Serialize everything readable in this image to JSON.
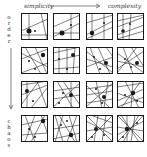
{
  "labels": {
    "top_left": "simplicity",
    "top_right": "complexity",
    "left_top": "order",
    "left_bottom": "chaos"
  },
  "grid": {
    "rows": 4,
    "cols": 4,
    "cells": [
      {
        "row": 0,
        "col": 0,
        "lines": [
          [
            8,
            0,
            8,
            27
          ],
          [
            20,
            0,
            26,
            27
          ],
          [
            0,
            18,
            27,
            6
          ],
          [
            0,
            22,
            27,
            22
          ]
        ],
        "dots": [
          [
            8,
            18,
            2.5
          ],
          [
            14,
            18,
            1
          ]
        ]
      },
      {
        "row": 0,
        "col": 1,
        "lines": [
          [
            0,
            14,
            27,
            2
          ],
          [
            0,
            24,
            27,
            10
          ],
          [
            18,
            0,
            18,
            27
          ],
          [
            0,
            20,
            27,
            20
          ]
        ],
        "dots": [
          [
            9,
            20,
            2.5
          ],
          [
            18,
            12,
            1
          ]
        ]
      },
      {
        "row": 0,
        "col": 2,
        "lines": [
          [
            0,
            10,
            27,
            2
          ],
          [
            0,
            22,
            27,
            8
          ],
          [
            0,
            26,
            27,
            14
          ],
          [
            6,
            0,
            6,
            27
          ],
          [
            18,
            0,
            18,
            27
          ]
        ],
        "dots": [
          [
            6,
            20,
            2.2
          ],
          [
            18,
            10,
            1
          ]
        ]
      },
      {
        "row": 0,
        "col": 3,
        "lines": [
          [
            0,
            8,
            27,
            2
          ],
          [
            0,
            14,
            27,
            4
          ],
          [
            0,
            22,
            27,
            12
          ],
          [
            0,
            26,
            27,
            18
          ],
          [
            6,
            0,
            6,
            27
          ],
          [
            14,
            0,
            12,
            27
          ]
        ],
        "dots": [
          [
            6,
            18,
            1.8
          ],
          [
            13,
            11,
            1
          ]
        ]
      },
      {
        "row": 1,
        "col": 0,
        "lines": [
          [
            0,
            12,
            27,
            2
          ],
          [
            0,
            26,
            27,
            16
          ],
          [
            4,
            0,
            20,
            27
          ],
          [
            14,
            0,
            26,
            27
          ],
          [
            0,
            6,
            27,
            20
          ]
        ],
        "dots": [
          [
            22,
            8,
            2.2
          ],
          [
            8,
            14,
            1
          ],
          [
            14,
            22,
            1
          ]
        ]
      },
      {
        "row": 1,
        "col": 1,
        "lines": [
          [
            0,
            6,
            27,
            0
          ],
          [
            0,
            14,
            27,
            8
          ],
          [
            0,
            22,
            27,
            20
          ],
          [
            6,
            0,
            6,
            27
          ],
          [
            14,
            0,
            14,
            27
          ],
          [
            22,
            0,
            20,
            27
          ]
        ],
        "dots": [
          [
            20,
            8,
            2
          ],
          [
            6,
            12,
            1
          ],
          [
            14,
            22,
            1
          ]
        ]
      },
      {
        "row": 1,
        "col": 2,
        "lines": [
          [
            0,
            4,
            27,
            26
          ],
          [
            0,
            12,
            27,
            20
          ],
          [
            4,
            0,
            14,
            27
          ],
          [
            12,
            0,
            24,
            27
          ],
          [
            0,
            20,
            27,
            10
          ],
          [
            20,
            0,
            27,
            10
          ]
        ],
        "dots": [
          [
            20,
            16,
            2
          ],
          [
            8,
            10,
            1
          ],
          [
            14,
            22,
            1
          ]
        ]
      },
      {
        "row": 1,
        "col": 3,
        "lines": [
          [
            0,
            6,
            27,
            26
          ],
          [
            0,
            14,
            27,
            20
          ],
          [
            6,
            0,
            16,
            27
          ],
          [
            14,
            0,
            27,
            20
          ],
          [
            0,
            22,
            27,
            4
          ],
          [
            20,
            0,
            0,
            26
          ]
        ],
        "dots": [
          [
            20,
            16,
            2
          ],
          [
            8,
            12,
            1
          ],
          [
            14,
            20,
            1
          ]
        ]
      },
      {
        "row": 2,
        "col": 0,
        "lines": [
          [
            0,
            4,
            27,
            0
          ],
          [
            0,
            14,
            27,
            4
          ],
          [
            6,
            0,
            6,
            27
          ],
          [
            16,
            0,
            26,
            27
          ],
          [
            0,
            24,
            18,
            0
          ],
          [
            10,
            27,
            27,
            6
          ]
        ],
        "dots": [
          [
            6,
            10,
            2
          ],
          [
            12,
            20,
            1
          ]
        ]
      },
      {
        "row": 2,
        "col": 1,
        "lines": [
          [
            0,
            10,
            27,
            6
          ],
          [
            0,
            18,
            27,
            14
          ],
          [
            4,
            0,
            20,
            27
          ],
          [
            18,
            0,
            18,
            27
          ],
          [
            0,
            26,
            27,
            2
          ],
          [
            10,
            0,
            27,
            24
          ]
        ],
        "dots": [
          [
            18,
            14,
            2
          ],
          [
            10,
            12,
            1
          ],
          [
            6,
            22,
            1
          ]
        ]
      },
      {
        "row": 2,
        "col": 2,
        "lines": [
          [
            0,
            8,
            27,
            4
          ],
          [
            0,
            14,
            27,
            10
          ],
          [
            0,
            22,
            27,
            18
          ],
          [
            10,
            0,
            16,
            27
          ],
          [
            22,
            0,
            18,
            27
          ],
          [
            0,
            4,
            24,
            27
          ],
          [
            0,
            26,
            27,
            2
          ]
        ],
        "dots": [
          [
            18,
            16,
            2
          ],
          [
            10,
            8,
            1
          ],
          [
            16,
            22,
            1
          ]
        ]
      },
      {
        "row": 2,
        "col": 3,
        "lines": [
          [
            0,
            6,
            27,
            2
          ],
          [
            0,
            12,
            27,
            22
          ],
          [
            0,
            20,
            27,
            8
          ],
          [
            8,
            0,
            22,
            27
          ],
          [
            16,
            0,
            14,
            27
          ],
          [
            24,
            0,
            4,
            27
          ],
          [
            0,
            26,
            27,
            16
          ]
        ],
        "dots": [
          [
            16,
            12,
            2.2
          ],
          [
            8,
            14,
            1
          ],
          [
            20,
            20,
            1
          ]
        ]
      },
      {
        "row": 3,
        "col": 0,
        "lines": [
          [
            4,
            0,
            14,
            27
          ],
          [
            14,
            0,
            4,
            27
          ],
          [
            20,
            0,
            27,
            20
          ],
          [
            0,
            10,
            27,
            4
          ],
          [
            0,
            20,
            27,
            18
          ],
          [
            10,
            27,
            24,
            0
          ]
        ],
        "dots": [
          [
            22,
            6,
            2.2
          ],
          [
            8,
            14,
            1
          ],
          [
            14,
            22,
            1
          ]
        ]
      },
      {
        "row": 3,
        "col": 1,
        "lines": [
          [
            2,
            0,
            10,
            27
          ],
          [
            10,
            0,
            2,
            27
          ],
          [
            16,
            0,
            24,
            27
          ],
          [
            24,
            0,
            14,
            27
          ],
          [
            0,
            14,
            27,
            10
          ],
          [
            0,
            24,
            27,
            18
          ],
          [
            6,
            0,
            22,
            27
          ]
        ],
        "dots": [
          [
            18,
            20,
            2.2
          ],
          [
            8,
            10,
            1
          ],
          [
            14,
            6,
            1
          ]
        ]
      },
      {
        "row": 3,
        "col": 2,
        "lines": [
          [
            0,
            0,
            27,
            27
          ],
          [
            27,
            0,
            0,
            27
          ],
          [
            12,
            0,
            8,
            27
          ],
          [
            20,
            0,
            16,
            27
          ],
          [
            0,
            16,
            27,
            12
          ],
          [
            0,
            6,
            27,
            20
          ],
          [
            4,
            0,
            27,
            8
          ]
        ],
        "dots": [
          [
            10,
            14,
            2
          ],
          [
            18,
            20,
            1
          ],
          [
            6,
            22,
            1
          ]
        ]
      },
      {
        "row": 3,
        "col": 3,
        "lines": [
          [
            0,
            0,
            27,
            27
          ],
          [
            27,
            0,
            0,
            27
          ],
          [
            10,
            0,
            10,
            27
          ],
          [
            18,
            0,
            14,
            27
          ],
          [
            0,
            12,
            27,
            16
          ],
          [
            0,
            20,
            27,
            6
          ],
          [
            4,
            0,
            22,
            27
          ],
          [
            22,
            0,
            6,
            27
          ]
        ],
        "dots": [
          [
            10,
            14,
            2.2
          ],
          [
            20,
            8,
            1
          ],
          [
            6,
            22,
            1
          ]
        ]
      }
    ]
  },
  "colors": {
    "ink": "#1a1a1a",
    "background": "#ffffff"
  }
}
